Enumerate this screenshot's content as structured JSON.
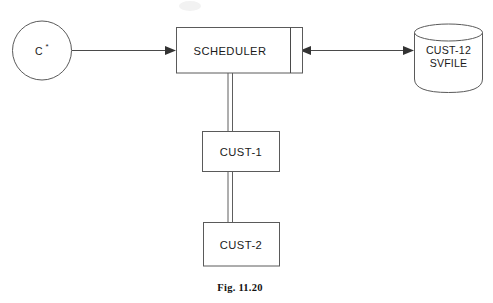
{
  "figure": {
    "caption": "Fig. 11.20",
    "background_color": "#ffffff",
    "stroke_color": "#5a5a5a",
    "text_color": "#1a1a1a"
  },
  "nodes": {
    "source": {
      "shape": "circle",
      "label": "C",
      "superscript": "*",
      "full_label": "C*"
    },
    "scheduler": {
      "shape": "rectangle",
      "label": "SCHEDULER",
      "has_right_compartment": true
    },
    "savefile": {
      "shape": "cylinder",
      "label_line_1": "CUST-12",
      "label_line_2": "SVFILE"
    },
    "cust1": {
      "shape": "rectangle",
      "label": "CUST-1"
    },
    "cust2": {
      "shape": "rectangle",
      "label": "CUST-2"
    }
  },
  "connectors": [
    {
      "name": "source-to-scheduler",
      "from": "source",
      "to": "scheduler",
      "style": "single-line",
      "arrow": "to-target"
    },
    {
      "name": "scheduler-to-savefile",
      "from": "scheduler",
      "to": "savefile",
      "style": "single-line",
      "arrow": "bidirectional"
    },
    {
      "name": "scheduler-to-cust1",
      "from": "scheduler",
      "to": "cust1",
      "style": "double-line",
      "arrow": "none"
    },
    {
      "name": "cust1-to-cust2",
      "from": "cust1",
      "to": "cust2",
      "style": "double-line",
      "arrow": "none"
    }
  ]
}
